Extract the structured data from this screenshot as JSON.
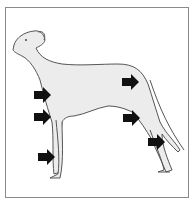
{
  "figure": {
    "arrow_color": "#111111",
    "body_fill": "#e8e8e8",
    "outline_color": "#555555",
    "frame_color": "#8a8a8a",
    "arrows": [
      {
        "target": "shoulder",
        "x": 34,
        "y": 95
      },
      {
        "target": "elbow",
        "x": 34,
        "y": 117
      },
      {
        "target": "front-pastern",
        "x": 38,
        "y": 157
      },
      {
        "target": "hip",
        "x": 122,
        "y": 82
      },
      {
        "target": "stifle",
        "x": 123,
        "y": 118
      },
      {
        "target": "hock",
        "x": 148,
        "y": 142
      }
    ]
  }
}
